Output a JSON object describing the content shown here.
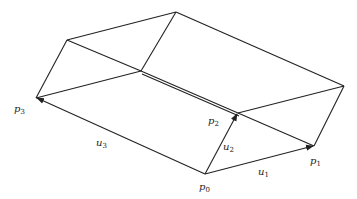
{
  "diagram": {
    "type": "parallelepiped-vectors",
    "vertices": [
      {
        "id": "p0",
        "label": "p",
        "subscript": "0"
      },
      {
        "id": "p1",
        "label": "p",
        "subscript": "1"
      },
      {
        "id": "p2",
        "label": "p",
        "subscript": "2"
      },
      {
        "id": "p3",
        "label": "p",
        "subscript": "3"
      }
    ],
    "vectors": [
      {
        "id": "u1",
        "label": "u",
        "subscript": "1",
        "from": "p0",
        "to": "p1"
      },
      {
        "id": "u2",
        "label": "u",
        "subscript": "2",
        "from": "p0",
        "to": "p2"
      },
      {
        "id": "u3",
        "label": "u",
        "subscript": "3",
        "from": "p0",
        "to": "p3"
      }
    ],
    "colors": {
      "stroke": "#222222",
      "background": "#ffffff"
    }
  }
}
